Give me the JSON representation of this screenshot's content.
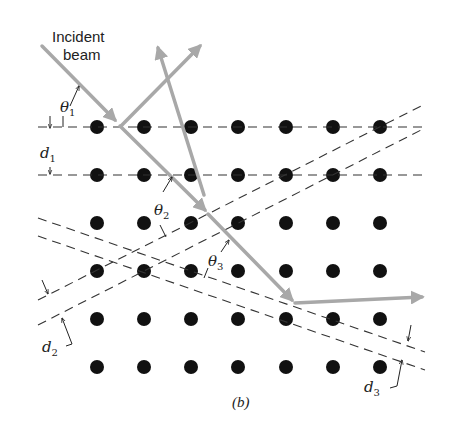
{
  "figure": {
    "caption": "(b)",
    "incident_label_line1": "Incident",
    "incident_label_line2": "beam",
    "labels": {
      "theta1": "θ",
      "theta1_sub": "1",
      "theta2": "θ",
      "theta2_sub": "2",
      "theta3": "θ",
      "theta3_sub": "3",
      "d1": "d",
      "d1_sub": "1",
      "d2": "d",
      "d2_sub": "2",
      "d3": "d",
      "d3_sub": "3"
    },
    "lattice": {
      "columns_x": [
        97,
        144,
        191,
        238,
        286,
        333,
        380
      ],
      "rows_y": [
        127,
        175,
        223,
        271,
        319,
        367
      ],
      "dot_radius": 7,
      "dot_color": "#111111"
    },
    "colors": {
      "beam": "#a8a8a8",
      "plane_line": "#333333"
    }
  }
}
